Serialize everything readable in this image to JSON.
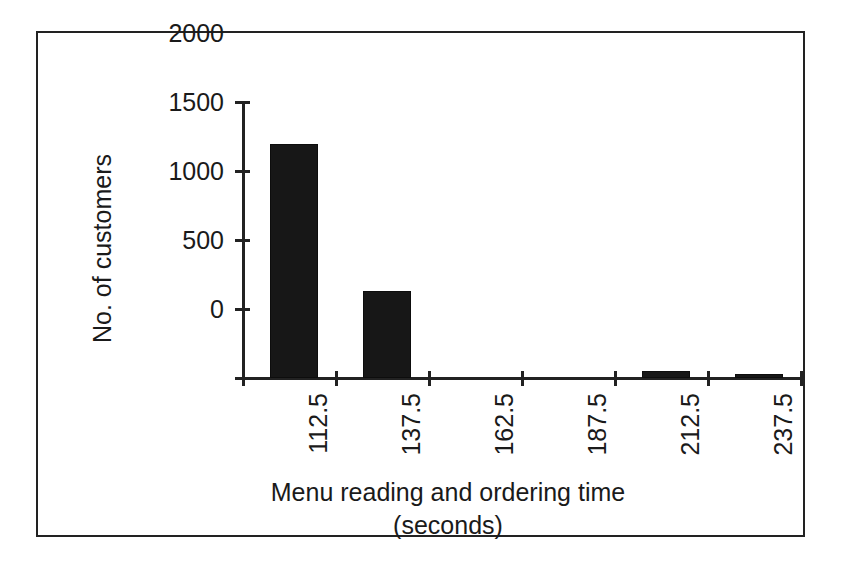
{
  "chart_data": {
    "type": "bar",
    "title": "",
    "xlabel_line1": "Menu reading and ordering time",
    "xlabel_line2": "(seconds)",
    "ylabel": "No. of customers",
    "categories": [
      "112.5",
      "137.5",
      "162.5",
      "187.5",
      "212.5",
      "237.5"
    ],
    "values": [
      1690,
      630,
      0,
      0,
      50,
      30
    ],
    "ylim": [
      0,
      2000
    ],
    "yticks": [
      "2000",
      "1500",
      "1000",
      "500",
      "0"
    ],
    "ytick_values": [
      2000,
      1500,
      1000,
      500,
      0
    ],
    "grid": false,
    "legend": false,
    "bar_color": "#171717",
    "axis_color": "#222222",
    "background_color": "#ffffff"
  },
  "figure": {
    "frame_border_color": "#222222"
  }
}
